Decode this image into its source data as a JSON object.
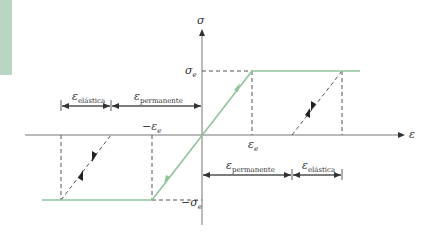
{
  "diagram": {
    "type": "stress-strain elastic-perfectly-plastic hysteresis",
    "axes": {
      "y_label": "σ",
      "x_label": "ε"
    },
    "ticks": {
      "sigma_e": "σ",
      "sigma_e_sub": "e",
      "neg_sigma_e": "−σ",
      "neg_sigma_e_sub": "e",
      "eps_e": "ε",
      "eps_e_sub": "e",
      "neg_eps_e": "−ε",
      "neg_eps_e_sub": "e"
    },
    "dimensions": {
      "top_left_elastic": {
        "symbol": "ε",
        "sub": "elástica"
      },
      "top_left_permanent": {
        "symbol": "ε",
        "sub": "permanente"
      },
      "bottom_right_permanent": {
        "symbol": "ε",
        "sub": "permanente"
      },
      "bottom_right_elastic": {
        "symbol": "ε",
        "sub": "elástica"
      }
    },
    "colors": {
      "curve": "#8fc49b",
      "axis": "#555555",
      "dash": "#555555",
      "side_band": "#b9d6c3"
    }
  }
}
